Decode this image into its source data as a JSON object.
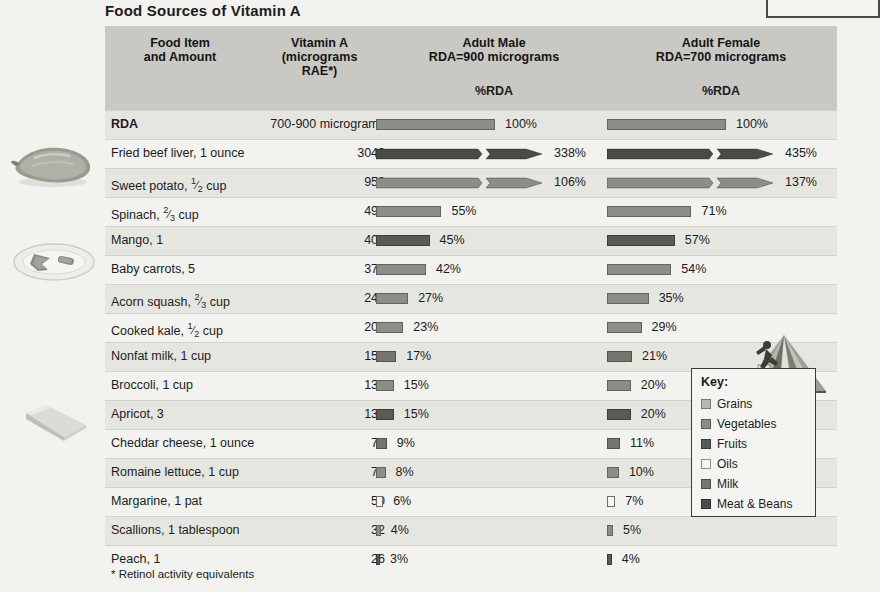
{
  "title": "Food Sources of Vitamin A",
  "footnote": "* Retinol activity equivalents",
  "header": {
    "food_item": "Food Item",
    "food_item_sub": "and Amount",
    "vitamin_a": "Vitamin A",
    "vitamin_a_sub1": "(micrograms",
    "vitamin_a_sub2": "RAE*)",
    "male": "Adult Male",
    "male_sub": "RDA=900 micrograms",
    "male_pct": "%RDA",
    "female": "Adult Female",
    "female_sub": "RDA=700 micrograms",
    "female_pct": "%RDA"
  },
  "colors": {
    "header_band": "#c9c9c4",
    "row_alt": "#e6e6e1",
    "row_plain": "#f2f2ee",
    "grains": "#b9b9b4",
    "vegetables": "#8d8d88",
    "fruits": "#5a5a56",
    "oils": "#f6f6f2",
    "milk": "#76766f",
    "meat_beans": "#4a4a46"
  },
  "key": {
    "title": "Key:",
    "items": [
      {
        "label": "Grains",
        "color": "#b9b9b4",
        "group": "grains"
      },
      {
        "label": "Vegetables",
        "color": "#8d8d88",
        "group": "vegetables"
      },
      {
        "label": "Fruits",
        "color": "#5a5a56",
        "group": "fruits"
      },
      {
        "label": "Oils",
        "color": "#f6f6f2",
        "group": "oils"
      },
      {
        "label": "Milk",
        "color": "#76766f",
        "group": "milk"
      },
      {
        "label": "Meat & Beans",
        "color": "#4a4a46",
        "group": "meat-beans"
      }
    ]
  },
  "chart_data": {
    "type": "bar",
    "title": "Food Sources of Vitamin A",
    "xlabel": "%RDA",
    "ylabel": "Food Item and Amount",
    "series": [
      {
        "name": "Adult Male RDA=900 micrograms",
        "unit": "%RDA"
      },
      {
        "name": "Adult Female RDA=700 micrograms",
        "unit": "%RDA"
      }
    ],
    "categories": [
      "RDA",
      "Fried beef liver, 1 ounce",
      "Sweet potato, 1/2 cup",
      "Spinach, 2/3 cup",
      "Mango, 1",
      "Baby carrots, 5",
      "Acorn squash, 2/3 cup",
      "Cooked kale, 1/2 cup",
      "Nonfat milk, 1 cup",
      "Broccoli, 1 cup",
      "Apricot, 3",
      "Cheddar cheese, 1 ounce",
      "Romaine lettuce, 1 cup",
      "Margarine, 1 pat",
      "Scallions, 1 tablespoon",
      "Peach, 1"
    ],
    "vitamin_a_rae": [
      null,
      3042,
      958,
      494,
      402,
      375,
      244,
      206,
      150,
      138,
      137,
      78,
      72,
      50,
      32,
      26
    ],
    "male_pct": [
      100,
      338,
      106,
      55,
      45,
      42,
      27,
      23,
      17,
      15,
      15,
      9,
      8,
      6,
      4,
      3
    ],
    "female_pct": [
      100,
      435,
      137,
      71,
      57,
      54,
      35,
      29,
      21,
      20,
      20,
      11,
      10,
      7,
      5,
      4
    ],
    "broken_axis_rows": [
      1,
      2
    ],
    "note": "Bars longer than 100% are drawn with a break mark and arrowhead."
  },
  "rows": [
    {
      "food": "RDA",
      "bold": true,
      "amount": "700-900 micrograms",
      "male_pct": "100%",
      "female_pct": "100%",
      "male_val": 100,
      "female_val": 100,
      "group": "vegetables",
      "broken": false,
      "alt": true
    },
    {
      "food": "Fried beef liver, 1 ounce",
      "bold": false,
      "amount": "3042",
      "male_pct": "338%",
      "female_pct": "435%",
      "male_val": 338,
      "female_val": 435,
      "group": "meat-beans",
      "broken": true,
      "alt": false
    },
    {
      "food": "Sweet potato, ",
      "frac": "1/2",
      "food_tail": " cup",
      "bold": false,
      "amount": "958",
      "male_pct": "106%",
      "female_pct": "137%",
      "male_val": 106,
      "female_val": 137,
      "group": "vegetables",
      "broken": true,
      "alt": true
    },
    {
      "food": "Spinach, ",
      "frac": "2/3",
      "food_tail": " cup",
      "bold": false,
      "amount": "494",
      "male_pct": "55%",
      "female_pct": "71%",
      "male_val": 55,
      "female_val": 71,
      "group": "vegetables",
      "broken": false,
      "alt": false
    },
    {
      "food": "Mango, 1",
      "bold": false,
      "amount": "402",
      "male_pct": "45%",
      "female_pct": "57%",
      "male_val": 45,
      "female_val": 57,
      "group": "fruits",
      "broken": false,
      "alt": true
    },
    {
      "food": "Baby carrots, 5",
      "bold": false,
      "amount": "375",
      "male_pct": "42%",
      "female_pct": "54%",
      "male_val": 42,
      "female_val": 54,
      "group": "vegetables",
      "broken": false,
      "alt": false
    },
    {
      "food": "Acorn squash, ",
      "frac": "2/3",
      "food_tail": " cup",
      "bold": false,
      "amount": "244",
      "male_pct": "27%",
      "female_pct": "35%",
      "male_val": 27,
      "female_val": 35,
      "group": "vegetables",
      "broken": false,
      "alt": true
    },
    {
      "food": "Cooked kale, ",
      "frac": "1/2",
      "food_tail": " cup",
      "bold": false,
      "amount": "206",
      "male_pct": "23%",
      "female_pct": "29%",
      "male_val": 23,
      "female_val": 29,
      "group": "vegetables",
      "broken": false,
      "alt": false
    },
    {
      "food": "Nonfat milk, 1 cup",
      "bold": false,
      "amount": "150",
      "male_pct": "17%",
      "female_pct": "21%",
      "male_val": 17,
      "female_val": 21,
      "group": "milk",
      "broken": false,
      "alt": true
    },
    {
      "food": "Broccoli, 1 cup",
      "bold": false,
      "amount": "138",
      "male_pct": "15%",
      "female_pct": "20%",
      "male_val": 15,
      "female_val": 20,
      "group": "vegetables",
      "broken": false,
      "alt": false
    },
    {
      "food": "Apricot, 3",
      "bold": false,
      "amount": "137",
      "male_pct": "15%",
      "female_pct": "20%",
      "male_val": 15,
      "female_val": 20,
      "group": "fruits",
      "broken": false,
      "alt": true
    },
    {
      "food": "Cheddar cheese, 1 ounce",
      "bold": false,
      "amount": "78",
      "male_pct": "9%",
      "female_pct": "11%",
      "male_val": 9,
      "female_val": 11,
      "group": "milk",
      "broken": false,
      "alt": false
    },
    {
      "food": "Romaine lettuce, 1 cup",
      "bold": false,
      "amount": "72",
      "male_pct": "8%",
      "female_pct": "10%",
      "male_val": 8,
      "female_val": 10,
      "group": "vegetables",
      "broken": false,
      "alt": true
    },
    {
      "food": "Margarine, 1 pat",
      "bold": false,
      "amount": "50",
      "male_pct": "6%",
      "female_pct": "7%",
      "male_val": 6,
      "female_val": 7,
      "group": "oils",
      "broken": false,
      "alt": false
    },
    {
      "food": "Scallions, 1 tablespoon",
      "bold": false,
      "amount": "32",
      "male_pct": "4%",
      "female_pct": "5%",
      "male_val": 4,
      "female_val": 5,
      "group": "vegetables",
      "broken": false,
      "alt": true
    },
    {
      "food": "Peach, 1",
      "bold": false,
      "amount": "26",
      "male_pct": "3%",
      "female_pct": "4%",
      "male_val": 3,
      "female_val": 4,
      "group": "fruits",
      "broken": false,
      "alt": false
    }
  ]
}
